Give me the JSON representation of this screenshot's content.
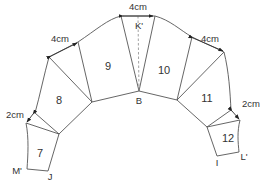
{
  "diagram": {
    "type": "pattern-layout",
    "segments": [
      {
        "id": "7",
        "label": "7"
      },
      {
        "id": "8",
        "label": "8"
      },
      {
        "id": "9",
        "label": "9"
      },
      {
        "id": "10",
        "label": "10"
      },
      {
        "id": "11",
        "label": "11"
      },
      {
        "id": "12",
        "label": "12"
      }
    ],
    "points": {
      "B": "B",
      "K": "K'",
      "M": "M'",
      "J": "J",
      "I": "I",
      "L": "L'"
    },
    "dimensions": {
      "top": "4cm",
      "upper_left": "4cm",
      "upper_right": "4cm",
      "lower_left": "2cm",
      "lower_right": "2cm"
    },
    "colors": {
      "line": "#555555",
      "text": "#333333",
      "background": "#ffffff"
    }
  }
}
